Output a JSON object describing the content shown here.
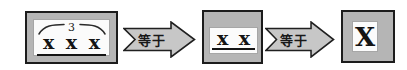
{
  "colors": {
    "background": "#ffffff",
    "box_fill": "#b5b5b5",
    "box_border": "#1c1c1c",
    "panel_fill": "#fbfbfb",
    "arrow_fill": "#c7c7c7",
    "arrow_border": "#202020",
    "text": "#141414"
  },
  "diagram": {
    "step1": {
      "brace_label": "3",
      "terms": [
        "x",
        "x",
        "x"
      ]
    },
    "arrow1": {
      "label": "等于"
    },
    "step2": {
      "terms": [
        "x",
        "x"
      ]
    },
    "arrow2": {
      "label": "等于"
    },
    "step3": {
      "term": "X"
    }
  }
}
